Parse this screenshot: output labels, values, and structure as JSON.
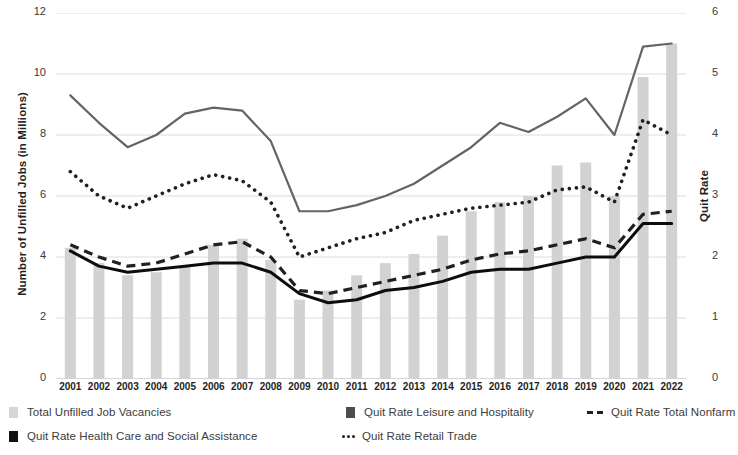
{
  "chart_data": {
    "type": "bar",
    "title": "",
    "xlabel": "",
    "ylabel": "Number of Unfilled Jobs (in Millions)",
    "y2label": "Quit Rate",
    "ylim": [
      0,
      12
    ],
    "y2lim": [
      0,
      6
    ],
    "yticks": [
      "0",
      "2",
      "4",
      "6",
      "8",
      "10",
      "12"
    ],
    "y2ticks": [
      "0",
      "1",
      "2",
      "3",
      "4",
      "5",
      "6"
    ],
    "grid": true,
    "legend_position": "bottom",
    "categories": [
      "2001",
      "2002",
      "2003",
      "2004",
      "2005",
      "2006",
      "2007",
      "2008",
      "2009",
      "2010",
      "2011",
      "2012",
      "2013",
      "2014",
      "2015",
      "2016",
      "2017",
      "2018",
      "2019",
      "2020",
      "2021",
      "2022"
    ],
    "series": [
      {
        "name": "Total Unfilled Job Vacancies",
        "type": "bar",
        "axis": "left",
        "unit": "millions",
        "color": "#d2d2d2",
        "values": [
          4.3,
          3.8,
          3.4,
          3.5,
          3.7,
          4.4,
          4.6,
          3.9,
          2.6,
          2.9,
          3.4,
          3.8,
          4.1,
          4.7,
          5.5,
          5.8,
          6.0,
          7.0,
          7.1,
          6.0,
          9.9,
          11.0
        ]
      },
      {
        "name": "Quit Rate Leisure and Hospitality",
        "type": "line",
        "style": "solid",
        "axis": "right",
        "color": "#646464",
        "values": [
          4.65,
          4.2,
          3.8,
          4.0,
          4.35,
          4.45,
          4.4,
          3.9,
          2.75,
          2.75,
          2.85,
          3.0,
          3.2,
          3.5,
          3.8,
          4.2,
          4.05,
          4.3,
          4.6,
          4.0,
          5.45,
          5.5
        ]
      },
      {
        "name": "Quit Rate Retail Trade",
        "type": "line",
        "style": "dotted",
        "axis": "right",
        "color": "#231f20",
        "values": [
          3.4,
          3.0,
          2.8,
          3.0,
          3.2,
          3.35,
          3.25,
          2.9,
          2.0,
          2.15,
          2.3,
          2.4,
          2.6,
          2.7,
          2.8,
          2.85,
          2.9,
          3.1,
          3.15,
          2.9,
          4.25,
          4.0
        ]
      },
      {
        "name": "Quit Rate Total Nonfarm",
        "type": "line",
        "style": "dashed",
        "axis": "right",
        "color": "#231f20",
        "values": [
          2.2,
          2.0,
          1.85,
          1.9,
          2.05,
          2.2,
          2.25,
          2.0,
          1.45,
          1.4,
          1.5,
          1.6,
          1.7,
          1.8,
          1.95,
          2.05,
          2.1,
          2.2,
          2.3,
          2.15,
          2.7,
          2.75
        ]
      },
      {
        "name": "Quit Rate Health Care and Social Assistance",
        "type": "line",
        "style": "solid",
        "axis": "right",
        "color": "#0d0d0d",
        "values": [
          2.1,
          1.85,
          1.75,
          1.8,
          1.85,
          1.9,
          1.9,
          1.75,
          1.4,
          1.25,
          1.3,
          1.45,
          1.5,
          1.6,
          1.75,
          1.8,
          1.8,
          1.9,
          2.0,
          2.0,
          2.55,
          2.55
        ]
      }
    ]
  },
  "axes": {
    "left_title": "Number of Unfilled Jobs (in Millions)",
    "right_title": "Quit Rate"
  },
  "legend": {
    "items": [
      {
        "label": "Total Unfilled Job Vacancies",
        "marker": "bar-swatch-light",
        "color": "#d2d2d2"
      },
      {
        "label": "Quit Rate Leisure and Hospitality",
        "marker": "bar-swatch-dark",
        "color": "#4d4d4d"
      },
      {
        "label": "Quit Rate Total Nonfarm",
        "marker": "dashed-line",
        "color": "#231f20"
      },
      {
        "label": "Quit Rate Health Care and Social Assistance",
        "marker": "bar-swatch-black",
        "color": "#0d0d0d"
      },
      {
        "label": "Quit Rate Retail Trade",
        "marker": "dotted-line",
        "color": "#231f20"
      }
    ]
  }
}
